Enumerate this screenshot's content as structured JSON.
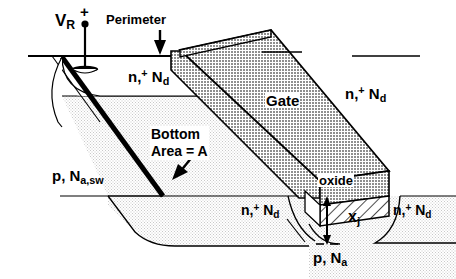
{
  "figure": {
    "type": "technical-line-diagram",
    "colors": {
      "outline": "#000000",
      "background": "#ffffff",
      "gate_fill": "#a8a8a8",
      "sidewall_fill": "#e6e6e6",
      "substrate_fill": "#ececec",
      "oxide_fill": "#ffffff",
      "top_face_fill": "#ffffff"
    }
  },
  "labels": {
    "voltage_source": {
      "symbol": "V",
      "subscript": "R",
      "polarity": "+"
    },
    "perimeter": "Perimeter",
    "gate": "Gate",
    "oxide": "oxide",
    "bottom_area_line1": "Bottom",
    "bottom_area_line2": "Area = A",
    "n_plus_top": {
      "base": "n,",
      "sup": "+",
      "n": "N",
      "sub": "d"
    },
    "n_plus_right": {
      "base": "n,",
      "sup": "+",
      "n": "N",
      "sub": "d"
    },
    "n_plus_front_left": {
      "base": "n,",
      "sup": "+",
      "n": "N",
      "sub": "d"
    },
    "n_plus_front_right": {
      "base": "n,",
      "sup": "+",
      "n": "N",
      "sub": "d"
    },
    "p_sidewall": {
      "base": "p,",
      "n": "N",
      "sub": "a,sw"
    },
    "p_substrate": {
      "base": "p,",
      "n": "N",
      "sub": "a"
    },
    "junction_depth": {
      "base": "x",
      "sub": "j"
    }
  },
  "annotations": [
    {
      "name": "perimeter-arrow",
      "points_to": "top surface perimeter edge",
      "direction": "down"
    },
    {
      "name": "bottom-area-arrow",
      "points_to": "bottom area face",
      "direction": "down-left"
    },
    {
      "name": "junction-depth-arrow",
      "points_to": "junction depth x_j",
      "direction": "double-vertical"
    }
  ]
}
